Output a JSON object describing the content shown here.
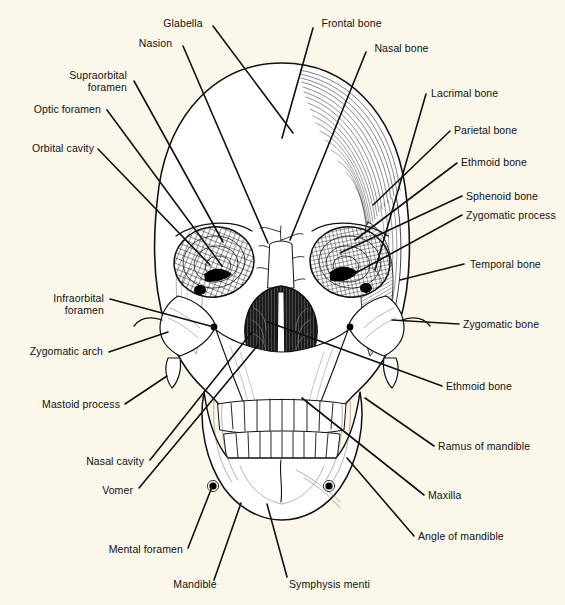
{
  "figure": {
    "background_color": "#fbf7ea",
    "ink_color": "#111111",
    "width": 565,
    "height": 605
  },
  "labels": [
    {
      "id": "glabella",
      "text": "Glabella",
      "align": "c",
      "x": 157,
      "y": 17,
      "w": 52,
      "line": [
        [
          213,
          26
        ],
        [
          293,
          133
        ]
      ]
    },
    {
      "id": "nasion",
      "text": "Nasion",
      "align": "c",
      "x": 133,
      "y": 37,
      "w": 45,
      "line": [
        [
          183,
          46
        ],
        [
          268,
          243
        ]
      ]
    },
    {
      "id": "frontal-bone",
      "text": "Frontal bone",
      "align": "c",
      "x": 315,
      "y": 17,
      "w": 73,
      "line": [
        [
          313,
          28
        ],
        [
          282,
          138
        ]
      ]
    },
    {
      "id": "nasal-bone",
      "text": "Nasal bone",
      "align": "c",
      "x": 368,
      "y": 42,
      "w": 67,
      "line": [
        [
          366,
          52
        ],
        [
          290,
          240
        ]
      ]
    },
    {
      "id": "supraorbital-foramen",
      "text": "Supraorbital\nforamen",
      "align": "r",
      "x": 54,
      "y": 69,
      "w": 73,
      "line": [
        [
          134,
          81
        ],
        [
          223,
          242
        ]
      ]
    },
    {
      "id": "optic-foramen",
      "text": "Optic foramen",
      "align": "r",
      "x": 20,
      "y": 103,
      "w": 81,
      "line": [
        [
          107,
          110
        ],
        [
          222,
          266
        ]
      ]
    },
    {
      "id": "orbital-cavity",
      "text": "Orbital cavity",
      "align": "r",
      "x": 14,
      "y": 142,
      "w": 80,
      "line": [
        [
          98,
          149
        ],
        [
          210,
          265
        ]
      ]
    },
    {
      "id": "lacrimal-bone",
      "text": "Lacrimal bone",
      "align": "l",
      "x": 431,
      "y": 87,
      "w": 83,
      "line": [
        [
          426,
          94
        ],
        [
          375,
          270
        ]
      ]
    },
    {
      "id": "parietal-bone",
      "text": "Parietal bone",
      "align": "l",
      "x": 454,
      "y": 124,
      "w": 80,
      "line": [
        [
          450,
          131
        ],
        [
          373,
          205
        ]
      ]
    },
    {
      "id": "ethmoid-bone-upper",
      "text": "Ethmoid bone",
      "align": "l",
      "x": 461,
      "y": 156,
      "w": 83,
      "line": [
        [
          457,
          163
        ],
        [
          355,
          240
        ]
      ]
    },
    {
      "id": "sphenoid-bone",
      "text": "Sphenoid bone",
      "align": "l",
      "x": 466,
      "y": 190,
      "w": 86,
      "line": [
        [
          462,
          196
        ],
        [
          340,
          253
        ]
      ]
    },
    {
      "id": "zygomatic-process",
      "text": "Zygomatic process",
      "align": "l",
      "x": 466,
      "y": 209,
      "w": 102,
      "line": [
        [
          462,
          215
        ],
        [
          352,
          275
        ]
      ]
    },
    {
      "id": "temporal-bone",
      "text": "Temporal bone",
      "align": "l",
      "x": 470,
      "y": 258,
      "w": 88,
      "line": [
        [
          464,
          264
        ],
        [
          400,
          280
        ]
      ]
    },
    {
      "id": "zygomatic-bone",
      "text": "Zygomatic bone",
      "align": "l",
      "x": 463,
      "y": 318,
      "w": 92,
      "line": [
        [
          459,
          324
        ],
        [
          392,
          320
        ]
      ]
    },
    {
      "id": "ethmoid-bone-lower",
      "text": "Ethmoid bone",
      "align": "l",
      "x": 446,
      "y": 380,
      "w": 83,
      "line": [
        [
          442,
          386
        ],
        [
          268,
          322
        ]
      ]
    },
    {
      "id": "infraorbital-foramen",
      "text": "Infraorbital\nforamen",
      "align": "r",
      "x": 31,
      "y": 292,
      "w": 73,
      "line": [
        [
          110,
          299
        ],
        [
          214,
          327
        ]
      ]
    },
    {
      "id": "zygomatic-arch",
      "text": "Zygomatic arch",
      "align": "r",
      "x": 13,
      "y": 345,
      "w": 90,
      "line": [
        [
          109,
          352
        ],
        [
          168,
          332
        ]
      ]
    },
    {
      "id": "mastoid-process",
      "text": "Mastoid process",
      "align": "r",
      "x": 24,
      "y": 398,
      "w": 96,
      "line": [
        [
          125,
          404
        ],
        [
          167,
          376
        ]
      ]
    },
    {
      "id": "nasal-cavity",
      "text": "Nasal cavity",
      "align": "r",
      "x": 66,
      "y": 455,
      "w": 78,
      "line": [
        [
          150,
          460
        ],
        [
          252,
          332
        ]
      ]
    },
    {
      "id": "vomer",
      "text": "Vomer",
      "align": "r",
      "x": 91,
      "y": 484,
      "w": 42,
      "line": [
        [
          139,
          488
        ],
        [
          258,
          345
        ]
      ]
    },
    {
      "id": "mental-foramen",
      "text": "Mental foramen",
      "align": "r",
      "x": 91,
      "y": 543,
      "w": 92,
      "line": [
        [
          188,
          548
        ],
        [
          212,
          487
        ]
      ]
    },
    {
      "id": "mandible",
      "text": "Mandible",
      "align": "c",
      "x": 168,
      "y": 578,
      "w": 54,
      "line": [
        [
          214,
          580
        ],
        [
          241,
          503
        ]
      ]
    },
    {
      "id": "symphysis-menti",
      "text": "Symphysis menti",
      "align": "l",
      "x": 289,
      "y": 578,
      "w": 98,
      "line": [
        [
          287,
          577
        ],
        [
          267,
          504
        ]
      ]
    },
    {
      "id": "ramus-of-mandible",
      "text": "Ramus of mandible",
      "align": "l",
      "x": 438,
      "y": 440,
      "w": 104,
      "line": [
        [
          434,
          446
        ],
        [
          365,
          398
        ]
      ]
    },
    {
      "id": "maxilla",
      "text": "Maxilla",
      "align": "l",
      "x": 428,
      "y": 489,
      "w": 48,
      "line": [
        [
          424,
          495
        ],
        [
          302,
          398
        ]
      ]
    },
    {
      "id": "angle-of-mandible",
      "text": "Angle of mandible",
      "align": "l",
      "x": 418,
      "y": 530,
      "w": 102,
      "line": [
        [
          414,
          536
        ],
        [
          347,
          458
        ]
      ]
    }
  ]
}
